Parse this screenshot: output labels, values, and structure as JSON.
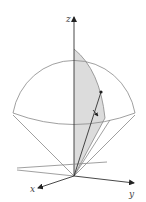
{
  "figure": {
    "axes": {
      "x_label": "x",
      "y_label": "y",
      "z_label": "z"
    },
    "colors": {
      "background": "#ffffff",
      "line": "#888888",
      "axis": "#333333",
      "shade": "#dcdcdc"
    },
    "elements": [
      "z-axis",
      "x-axis",
      "y-axis",
      "sphere-outline",
      "equator-ellipse",
      "cone-edges",
      "shaded-wedge",
      "point-on-sphere",
      "radius-line",
      "angle-arrow"
    ]
  }
}
